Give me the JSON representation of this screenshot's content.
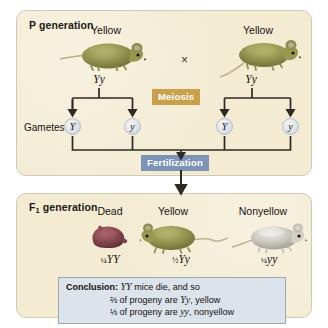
{
  "figure": {
    "background_color": "#ffffff"
  },
  "p_panel": {
    "title": "P generation",
    "panel_color": "#f3ebd2",
    "cross_symbol": "×",
    "parents": [
      {
        "phenotype": "Yellow",
        "genotype": "Yy",
        "mouse_color": "#8f9152"
      },
      {
        "phenotype": "Yellow",
        "genotype": "Yy",
        "mouse_color": "#8f9152"
      }
    ],
    "gametes_label": "Gametes",
    "gametes": [
      {
        "allele": "Y"
      },
      {
        "allele": "y"
      },
      {
        "allele": "Y"
      },
      {
        "allele": "y"
      }
    ]
  },
  "process_labels": {
    "meiosis": {
      "text": "Meiosis",
      "color": "#c9a14a"
    },
    "fertilization": {
      "text": "Fertilization",
      "color": "#7d94b8"
    }
  },
  "f1_panel": {
    "title_prefix": "F",
    "title_sub": "1",
    "title_suffix": " generation",
    "panel_color": "#f3ebd2",
    "offspring": [
      {
        "phenotype": "Dead",
        "fraction": "¼",
        "genotype": "YY",
        "mouse_color": "#8a4a4a"
      },
      {
        "phenotype": "Yellow",
        "fraction": "½",
        "genotype": "Yy",
        "mouse_color": "#8f9152"
      },
      {
        "phenotype": "Nonyellow",
        "fraction": "¼",
        "genotype": "yy",
        "mouse_color": "#c9c7c0"
      }
    ]
  },
  "conclusion": {
    "label": "Conclusion:",
    "line1_genotype": "YY",
    "line1_text": " mice die, and so",
    "line2_fraction": "⅔",
    "line2_text_a": " of progeny are ",
    "line2_genotype": "Yy",
    "line2_text_b": ", yellow",
    "line3_fraction": "⅓",
    "line3_text_a": " of progeny are ",
    "line3_genotype": "yy",
    "line3_text_b": ", nonyellow",
    "box_color": "#dce3ea"
  }
}
